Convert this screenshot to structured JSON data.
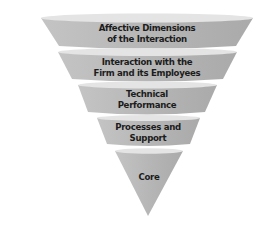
{
  "diagram": {
    "type": "inverted-cone-funnel",
    "colors": {
      "band_fill": "#b9b9b9",
      "band_top": "#e2e2e2",
      "band_shadow": "#a6a6a6",
      "text": "#1c1c1c",
      "background": "#ffffff"
    },
    "layers": [
      {
        "id": "affective",
        "line1": "Affective Dimensions",
        "line2": "of the Interaction"
      },
      {
        "id": "interaction",
        "line1": "Interaction with the",
        "line2": "Firm and its Employees"
      },
      {
        "id": "technical",
        "line1": "Technical",
        "line2": "Performance"
      },
      {
        "id": "processes",
        "line1": "Processes and",
        "line2": "Support"
      },
      {
        "id": "core",
        "line1": "Core",
        "line2": ""
      }
    ]
  }
}
